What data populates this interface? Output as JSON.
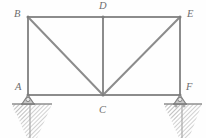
{
  "figure": {
    "kind": "plane-truss-free-body-diagram",
    "background_color": "#fefefe",
    "member_color": "#8c8c8c",
    "label_color": "#6e6e6e",
    "support_color": "#8f8f8f",
    "hatch_color": "#9b9b9b",
    "width": 206,
    "height": 138
  },
  "nodes": [
    {
      "id": "A",
      "label": "A",
      "x": 28,
      "y": 95,
      "label_x": 15,
      "label_y": 82
    },
    {
      "id": "B",
      "label": "B",
      "x": 28,
      "y": 17,
      "label_x": 14,
      "label_y": 9
    },
    {
      "id": "C",
      "label": "C",
      "x": 103,
      "y": 95,
      "label_x": 99,
      "label_y": 104
    },
    {
      "id": "D",
      "label": "D",
      "x": 103,
      "y": 17,
      "label_x": 99,
      "label_y": 2
    },
    {
      "id": "E",
      "label": "E",
      "x": 180,
      "y": 17,
      "label_x": 187,
      "label_y": 9
    },
    {
      "id": "F",
      "label": "F",
      "x": 180,
      "y": 95,
      "label_x": 186,
      "label_y": 82
    }
  ],
  "members": [
    {
      "name": "top-chord-B-D",
      "from": "B",
      "to": "D"
    },
    {
      "name": "top-chord-D-E",
      "from": "D",
      "to": "E"
    },
    {
      "name": "bottom-chord-A-C",
      "from": "A",
      "to": "C"
    },
    {
      "name": "bottom-chord-C-F",
      "from": "C",
      "to": "F"
    },
    {
      "name": "vertical-A-B",
      "from": "A",
      "to": "B"
    },
    {
      "name": "vertical-D-C",
      "from": "D",
      "to": "C"
    },
    {
      "name": "vertical-E-F",
      "from": "E",
      "to": "F"
    },
    {
      "name": "diagonal-B-C",
      "from": "B",
      "to": "C"
    },
    {
      "name": "diagonal-C-E",
      "from": "C",
      "to": "E"
    }
  ],
  "supports": [
    {
      "name": "pin-support-A",
      "at_node": "A",
      "type": "pin",
      "ground_line_x1": 12,
      "ground_line_x2": 52,
      "ground_line_y": 104
    },
    {
      "name": "roller-support-F",
      "at_node": "F",
      "type": "roller",
      "ground_line_x1": 164,
      "ground_line_x2": 202,
      "ground_line_y": 104
    }
  ],
  "labels": {
    "A": "A",
    "B": "B",
    "C": "C",
    "D": "D",
    "E": "E",
    "F": "F"
  }
}
